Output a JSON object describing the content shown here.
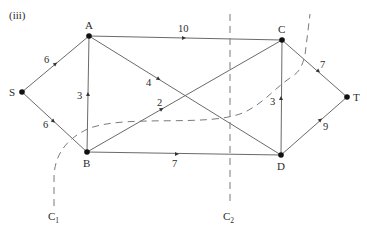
{
  "figure": {
    "part_label": "(iii)",
    "caption": ""
  },
  "nodes": [
    {
      "id": "S",
      "label": "S",
      "x": 22,
      "y": 92
    },
    {
      "id": "A",
      "label": "A",
      "x": 89,
      "y": 36
    },
    {
      "id": "B",
      "label": "B",
      "x": 87,
      "y": 152
    },
    {
      "id": "C",
      "label": "C",
      "x": 282,
      "y": 40
    },
    {
      "id": "D",
      "label": "D",
      "x": 281,
      "y": 155
    },
    {
      "id": "T",
      "label": "T",
      "x": 347,
      "y": 97
    }
  ],
  "edges": [
    {
      "from": "S",
      "to": "A",
      "weight": "6"
    },
    {
      "from": "S",
      "to": "B",
      "weight": "6"
    },
    {
      "from": "B",
      "to": "A",
      "weight": "3"
    },
    {
      "from": "A",
      "to": "C",
      "weight": "10"
    },
    {
      "from": "A",
      "to": "D",
      "weight": "4"
    },
    {
      "from": "B",
      "to": "C",
      "weight": "2"
    },
    {
      "from": "B",
      "to": "D",
      "weight": "7"
    },
    {
      "from": "D",
      "to": "C",
      "weight": "3"
    },
    {
      "from": "C",
      "to": "T",
      "weight": "7"
    },
    {
      "from": "D",
      "to": "T",
      "weight": "9"
    }
  ],
  "cuts": [
    {
      "id": "C1",
      "label": "C",
      "subscript": "1"
    },
    {
      "id": "C2",
      "label": "C",
      "subscript": "2"
    }
  ],
  "colors": {
    "edge": "#6a6a6a",
    "node": "#111111",
    "text": "#2b2b2b",
    "background": "#ffffff"
  }
}
